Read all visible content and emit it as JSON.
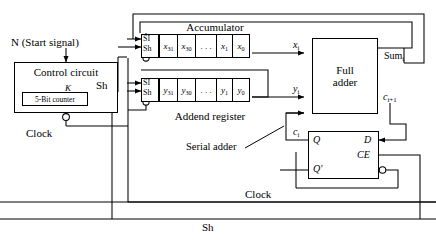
{
  "diagram": {
    "colors": {
      "line": "#000000",
      "background": "#ffffff",
      "text": "#000000"
    }
  },
  "signals": {
    "start": "N (Start signal)",
    "shift": "Sh",
    "clock": "Clock",
    "counter_enable": "K"
  },
  "control": {
    "title": "Control circuit",
    "counter": "5-Bit counter",
    "clock_label": "Clock"
  },
  "accumulator": {
    "title": "Accumulator",
    "pin_si": "SI",
    "pin_sh": "Sh",
    "cells": [
      "x31",
      "x30",
      ". . .",
      "x1",
      "x0"
    ],
    "cells_display": [
      {
        "base": "x",
        "sub": "31"
      },
      {
        "base": "x",
        "sub": "30"
      },
      {
        "base": ". . .",
        "sub": ""
      },
      {
        "base": "x",
        "sub": "1"
      },
      {
        "base": "x",
        "sub": "0"
      }
    ]
  },
  "addend": {
    "title": "Addend register",
    "pin_si": "SI",
    "pin_sh": "Sh",
    "cells_display": [
      {
        "base": "y",
        "sub": "31"
      },
      {
        "base": "y",
        "sub": "30"
      },
      {
        "base": ". . .",
        "sub": ""
      },
      {
        "base": "y",
        "sub": "1"
      },
      {
        "base": "y",
        "sub": "0"
      }
    ]
  },
  "full_adder": {
    "title_line1": "Full",
    "title_line2": "adder",
    "inputs": [
      {
        "base": "x",
        "sub": "i"
      },
      {
        "base": "y",
        "sub": "i"
      },
      {
        "base": "c",
        "sub": "i"
      }
    ],
    "outputs": [
      {
        "base": "Sum",
        "sub": "i"
      },
      {
        "base": "c",
        "sub": "i+1"
      }
    ]
  },
  "flipflop": {
    "q": "Q",
    "qbar": "Q'",
    "d": "D",
    "ce": "CE"
  },
  "annotations": {
    "serial_adder": "Serial adder"
  },
  "buses": {
    "clock": "Clock",
    "shift": "Sh"
  }
}
